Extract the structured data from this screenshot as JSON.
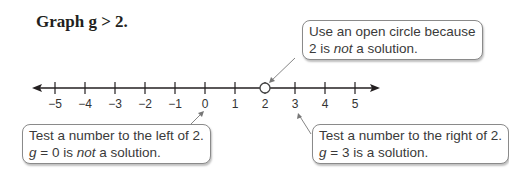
{
  "title": "Graph g > 2.",
  "callouts": {
    "top": {
      "line1": "Use an open circle because",
      "line2_pre": "2 is ",
      "line2_em": "not",
      "line2_post": " a solution."
    },
    "left": {
      "line1": "Test a number to the left of 2.",
      "line2_var": "g",
      "line2_pre": " = 0 is ",
      "line2_em": "not",
      "line2_post": " a solution."
    },
    "right": {
      "line1": "Test a number to the right of 2.",
      "line2_var": "g",
      "line2_post": " = 3 is a solution."
    }
  },
  "number_line": {
    "ticks": [
      "−5",
      "−4",
      "−3",
      "−2",
      "−1",
      "0",
      "1",
      "2",
      "3",
      "4",
      "5"
    ],
    "open_circle_at": "2",
    "direction": "right"
  }
}
